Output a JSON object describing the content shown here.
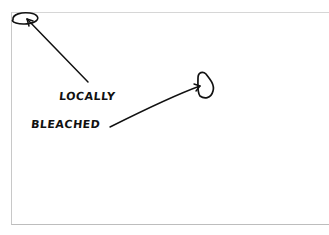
{
  "annotation": {
    "label_line1": "LOCALLY",
    "label_line2": "BLEACHED",
    "ink_color": "#111111",
    "frame_color": "#c8c8c8"
  }
}
